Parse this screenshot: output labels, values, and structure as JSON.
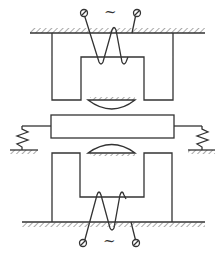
{
  "diagram": {
    "type": "electromagnetic schematic",
    "colors": {
      "line": "#333333",
      "background": "#ffffff"
    },
    "top_source": {
      "symbol": "~",
      "label": "AC source (top)"
    },
    "bottom_source": {
      "symbol": "~",
      "label": "AC source (bottom)"
    },
    "components": [
      "top-ground",
      "top-core",
      "top-coil",
      "top-terminals",
      "upper-pole-shoe",
      "armature-bar",
      "left-spring",
      "right-spring",
      "lower-pole-shoe",
      "bottom-core",
      "bottom-coil",
      "bottom-terminals",
      "bottom-ground"
    ]
  }
}
